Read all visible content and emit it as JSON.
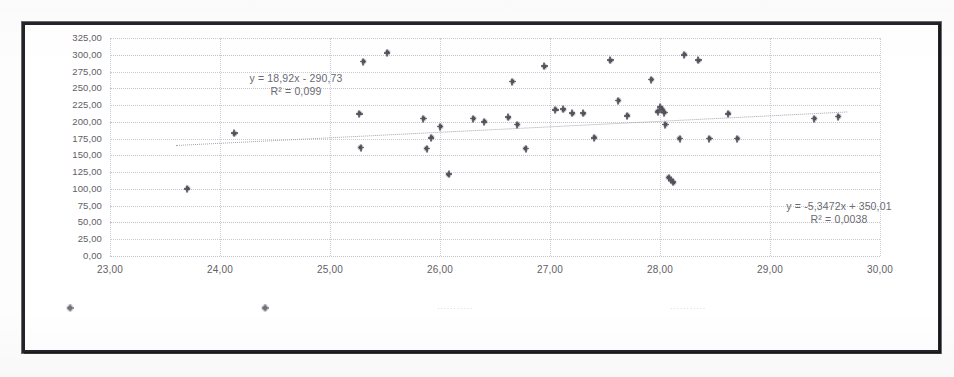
{
  "chart_data": {
    "type": "scatter",
    "title": "",
    "xlabel": "",
    "ylabel": "",
    "xlim": [
      23,
      30
    ],
    "ylim": [
      0,
      325
    ],
    "grid": true,
    "legend_position": "bottom",
    "x_ticks": [
      "23,00",
      "24,00",
      "25,00",
      "26,00",
      "27,00",
      "28,00",
      "29,00",
      "30,00"
    ],
    "y_ticks": [
      "0,00",
      "25,00",
      "50,00",
      "75,00",
      "100,00",
      "125,00",
      "150,00",
      "175,00",
      "200,00",
      "225,00",
      "250,00",
      "275,00",
      "300,00",
      "325,00"
    ],
    "x_tick_values": [
      23,
      24,
      25,
      26,
      27,
      28,
      29,
      30
    ],
    "y_tick_values": [
      0,
      25,
      50,
      75,
      100,
      125,
      150,
      175,
      200,
      225,
      250,
      275,
      300,
      325
    ],
    "series": [
      {
        "name": "series-1",
        "marker": "diamond",
        "color": "#4a4a52",
        "points": [
          [
            23.7,
            100
          ],
          [
            24.13,
            183
          ],
          [
            25.27,
            212
          ],
          [
            25.3,
            290
          ],
          [
            25.28,
            162
          ],
          [
            25.52,
            303
          ],
          [
            25.85,
            205
          ],
          [
            25.88,
            160
          ],
          [
            25.92,
            176
          ],
          [
            26.0,
            193
          ],
          [
            26.08,
            122
          ],
          [
            26.3,
            205
          ],
          [
            26.4,
            200
          ],
          [
            26.62,
            207
          ],
          [
            26.66,
            260
          ],
          [
            26.7,
            196
          ],
          [
            26.78,
            160
          ],
          [
            26.95,
            283
          ],
          [
            27.05,
            218
          ],
          [
            27.12,
            219
          ],
          [
            27.2,
            213
          ],
          [
            27.3,
            213
          ],
          [
            27.4,
            176
          ],
          [
            27.55,
            292
          ],
          [
            27.62,
            232
          ],
          [
            27.7,
            209
          ],
          [
            27.92,
            263
          ],
          [
            27.98,
            215
          ],
          [
            28.0,
            222
          ],
          [
            28.02,
            218
          ],
          [
            28.04,
            214
          ],
          [
            28.05,
            196
          ],
          [
            28.08,
            117
          ],
          [
            28.1,
            113
          ],
          [
            28.12,
            110
          ],
          [
            28.18,
            175
          ],
          [
            28.22,
            300
          ],
          [
            28.35,
            292
          ],
          [
            28.45,
            175
          ],
          [
            28.62,
            212
          ],
          [
            28.7,
            175
          ],
          [
            29.4,
            205
          ],
          [
            29.62,
            208
          ]
        ]
      }
    ],
    "trendlines": [
      {
        "name": "trendline-1",
        "equation": "y = 18,92x - 290,73",
        "r2": "R² = 0,099",
        "slope": 18.92,
        "intercept": -290.73,
        "x_start": 23.6,
        "x_end": 29.7,
        "y_start": 166,
        "y_end": 216,
        "style": "dotted"
      },
      {
        "name": "trendline-2",
        "equation": "y = -5,3472x + 350,01",
        "r2": "R² = 0,0038",
        "slope": -5.3472,
        "intercept": 350.01
      }
    ],
    "annotations": [
      {
        "name": "equation-label-1",
        "line1": "y = 18,92x - 290,73",
        "line2": "R² = 0,099",
        "x": 296,
        "y": 72
      },
      {
        "name": "equation-label-2",
        "line1": "y = -5,3472x + 350,01",
        "line2": "R² = 0,0038",
        "x": 839,
        "y": 200
      }
    ],
    "legend": [
      {
        "name": "legend-entry-1",
        "marker_x": 95,
        "marker_y": 333,
        "label": "",
        "label_x": 0
      },
      {
        "name": "legend-entry-2",
        "marker_x": 290,
        "marker_y": 333,
        "label": "",
        "label_x": 0
      },
      {
        "name": "legend-text-1",
        "marker_x": 0,
        "marker_y": 0,
        "label": "···········",
        "label_x": 480
      },
      {
        "name": "legend-text-2",
        "marker_x": 0,
        "marker_y": 0,
        "label": "···········",
        "label_x": 713
      }
    ]
  },
  "colors": {
    "frame": "#23242a",
    "grid": "#c9c9cf",
    "marker": "#4a4a52",
    "text": "#5f6066",
    "trendline": "#9a9aa4",
    "legend_text": "#d4d4da"
  }
}
